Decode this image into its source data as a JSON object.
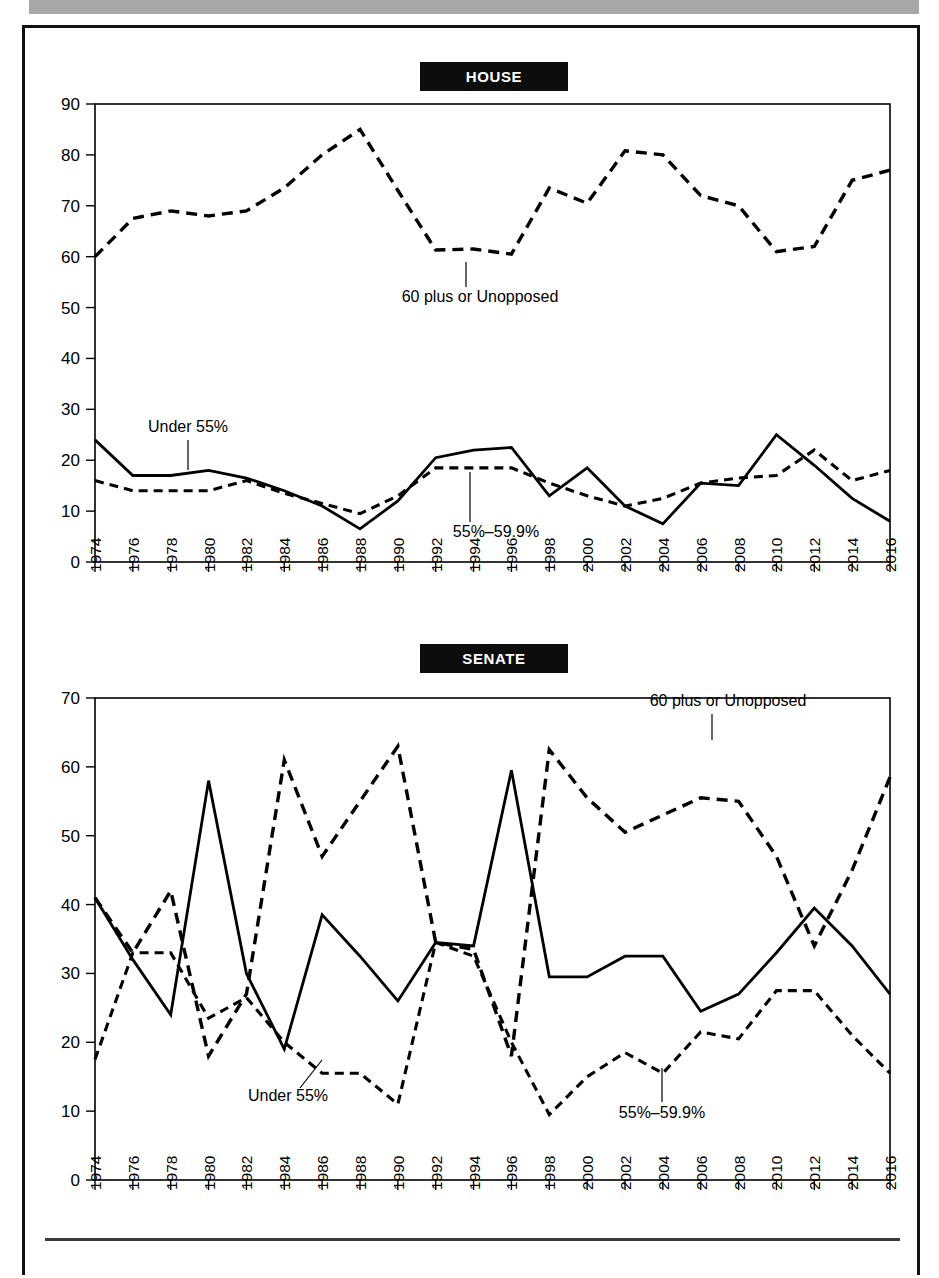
{
  "page": {
    "banner_color": "#a8a8a8",
    "frame_color": "#111111",
    "ink_color": "#000000"
  },
  "charts": [
    {
      "id": "house",
      "title": "HOUSE"
    },
    {
      "id": "senate",
      "title": "SENATE"
    }
  ],
  "labels": {
    "sixty_plus": "60 plus or Unopposed",
    "under_55": "Under 55%",
    "band_55_60": "55%–59.9%"
  },
  "chart_data": [
    {
      "type": "line",
      "title": "HOUSE",
      "xlabel": "",
      "ylabel": "",
      "xlim": [
        1974,
        2016
      ],
      "ylim": [
        0,
        90
      ],
      "ytick_step": 10,
      "yticks": [
        0,
        10,
        20,
        30,
        40,
        50,
        60,
        70,
        80,
        90
      ],
      "grid": false,
      "legend_position": "inline-annotations",
      "categories": [
        1974,
        1976,
        1978,
        1980,
        1982,
        1984,
        1986,
        1988,
        1990,
        1992,
        1994,
        1996,
        1998,
        2000,
        2002,
        2004,
        2006,
        2008,
        2010,
        2012,
        2014,
        2016
      ],
      "xtick_labels": [
        "1974",
        "1976",
        "1978",
        "1980",
        "1982",
        "1984",
        "1986",
        "1988",
        "1990",
        "1992",
        "1994",
        "1996",
        "1998",
        "2000",
        "2002",
        "2004",
        "2006",
        "2008",
        "2010",
        "2012",
        "2014",
        "2016"
      ],
      "series": [
        {
          "name": "60 plus or Unopposed",
          "style": "dashed-long",
          "values": [
            60,
            67.5,
            69,
            68,
            69,
            73.5,
            80,
            85,
            73,
            61.3,
            61.5,
            60.5,
            73.5,
            70.5,
            80.8,
            80,
            72,
            70,
            61,
            62,
            75,
            77
          ]
        },
        {
          "name": "Under 55%",
          "style": "solid",
          "values": [
            24,
            17,
            17,
            18,
            16.5,
            14,
            11,
            6.5,
            12,
            20.5,
            22,
            22.5,
            13,
            18.5,
            11,
            7.5,
            15.5,
            15,
            25,
            19,
            12.5,
            8
          ]
        },
        {
          "name": "55%–59.9%",
          "style": "dashed-short",
          "values": [
            16,
            14,
            14,
            14,
            16,
            13.5,
            11.5,
            9.5,
            13,
            18.5,
            18.5,
            18.5,
            15.5,
            13,
            11,
            12.5,
            15.5,
            16.5,
            17,
            22,
            16,
            18
          ]
        }
      ],
      "annotations": [
        {
          "text": "60 plus or Unopposed",
          "anchor_year": 1992,
          "anchor_value": 61.3
        },
        {
          "text": "Under 55%",
          "anchor_year": 1978,
          "anchor_value": 17
        },
        {
          "text": "55%–59.9%",
          "anchor_year": 1994,
          "anchor_value": 18.5
        }
      ]
    },
    {
      "type": "line",
      "title": "SENATE",
      "xlabel": "",
      "ylabel": "",
      "xlim": [
        1974,
        2016
      ],
      "ylim": [
        0,
        70
      ],
      "ytick_step": 10,
      "yticks": [
        0,
        10,
        20,
        30,
        40,
        50,
        60,
        70
      ],
      "grid": false,
      "legend_position": "inline-annotations",
      "categories": [
        1974,
        1976,
        1978,
        1980,
        1982,
        1984,
        1986,
        1988,
        1990,
        1992,
        1994,
        1996,
        1998,
        2000,
        2002,
        2004,
        2006,
        2008,
        2010,
        2012,
        2014,
        2016
      ],
      "xtick_labels": [
        "1974",
        "1976",
        "1978",
        "1980",
        "1982",
        "1984",
        "1986",
        "1988",
        "1990",
        "1992",
        "1994",
        "1996",
        "1998",
        "2000",
        "2002",
        "2004",
        "2006",
        "2008",
        "2010",
        "2012",
        "2014",
        "2016"
      ],
      "series": [
        {
          "name": "60 plus or Unopposed",
          "style": "dashed-long",
          "values": [
            41,
            33,
            42,
            18,
            27,
            61,
            47,
            55,
            63,
            34.5,
            33.5,
            18,
            62.5,
            55.5,
            50.5,
            53,
            55.5,
            55,
            47,
            34,
            45,
            58.5
          ]
        },
        {
          "name": "Under 55%",
          "style": "solid",
          "values": [
            41,
            32,
            24,
            58,
            30,
            19,
            38.5,
            32.5,
            26,
            34.5,
            34,
            59.5,
            29.5,
            29.5,
            32.5,
            32.5,
            24.5,
            27,
            33,
            39.5,
            34,
            27
          ]
        },
        {
          "name": "55%–59.9%",
          "style": "dashed-short",
          "values": [
            17.5,
            33,
            33,
            23.5,
            26.5,
            20,
            15.5,
            15.5,
            11,
            34.5,
            32.5,
            20,
            9.5,
            15,
            18.5,
            15.5,
            21.5,
            20.5,
            27.5,
            27.5,
            21,
            15.5
          ]
        }
      ],
      "annotations": [
        {
          "text": "60 plus or Unopposed",
          "anchor_year": 2006,
          "anchor_value": 55.5
        },
        {
          "text": "Under 55%",
          "anchor_year": 1996,
          "anchor_value": 28
        },
        {
          "text": "55%–59.9%",
          "anchor_year": 2010,
          "anchor_value": 27.5
        }
      ]
    }
  ]
}
